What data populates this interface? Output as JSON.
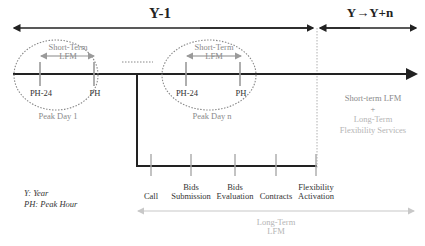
{
  "header": {
    "period_left": "Y-1",
    "period_right": "Y→Y+n"
  },
  "peak_days": [
    {
      "label": "Peak Day 1",
      "short_term_label_line1": "Short-Term",
      "short_term_label_line2": "LFM",
      "tick_left": "PH-24",
      "tick_right": "PH"
    },
    {
      "label": "Peak Day n",
      "short_term_label_line1": "Short-Term",
      "short_term_label_line2": "LFM",
      "tick_left": "PH-24",
      "tick_right": "PH"
    }
  ],
  "right_panel": {
    "line1": "Short-term LFM",
    "plus": "+",
    "line2": "Long-Term",
    "line3": "Flexibility Services"
  },
  "legend": {
    "line1": "Y: Year",
    "line2": "PH: Peak Hour"
  },
  "long_term_steps": [
    {
      "line1": "",
      "line2": "Call"
    },
    {
      "line1": "Bids",
      "line2": "Submission"
    },
    {
      "line1": "Bids",
      "line2": "Evaluation"
    },
    {
      "line1": "",
      "line2": "Contracts"
    },
    {
      "line1": "Flexibility",
      "line2": "Activation"
    }
  ],
  "long_term_label": {
    "line1": "Long-Term",
    "line2": "LFM"
  },
  "colors": {
    "main_line": "#222222",
    "tick": "#9a9a9a",
    "ellipse": "#888888",
    "short_term_arrow": "#9a9a9a",
    "long_term_arrow": "#c8c8c8",
    "divider": "#b0b0b0"
  }
}
